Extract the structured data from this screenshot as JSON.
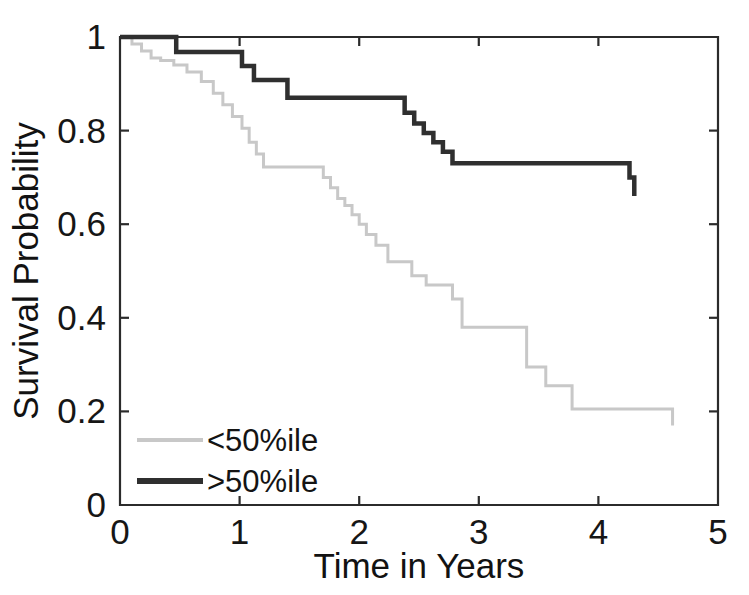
{
  "figure": {
    "background_color": "#ffffff",
    "plot_area": {
      "left": 120,
      "top": 37,
      "right": 718,
      "bottom": 505
    }
  },
  "chart_data": {
    "type": "line",
    "subtype": "kaplan-meier-step",
    "title": "",
    "xlabel": "Time in Years",
    "ylabel": "Survival Probability",
    "xlim": [
      0,
      5
    ],
    "ylim": [
      0,
      1
    ],
    "xticks": [
      0,
      1,
      2,
      3,
      4,
      5
    ],
    "xticklabels": [
      "0",
      "1",
      "2",
      "3",
      "4",
      "5"
    ],
    "yticks": [
      0,
      0.2,
      0.4,
      0.6,
      0.8,
      1
    ],
    "yticklabels": [
      "0",
      "0.2",
      "0.4",
      "0.6",
      "0.8",
      "1"
    ],
    "grid": false,
    "legend_position": "lower left",
    "series": [
      {
        "name": "<50%ile",
        "color": "#c8c8c8",
        "line_width": 3.0,
        "x": [
          0.0,
          0.1,
          0.18,
          0.26,
          0.34,
          0.45,
          0.56,
          0.68,
          0.78,
          0.86,
          0.94,
          1.02,
          1.08,
          1.14,
          1.2,
          1.62,
          1.7,
          1.76,
          1.82,
          1.88,
          1.94,
          2.0,
          2.06,
          2.14,
          2.24,
          2.34,
          2.44,
          2.56,
          2.78,
          2.86,
          3.3,
          3.4,
          3.56,
          3.78,
          4.62
        ],
        "y": [
          1.0,
          0.985,
          0.97,
          0.955,
          0.95,
          0.94,
          0.925,
          0.905,
          0.88,
          0.855,
          0.83,
          0.805,
          0.775,
          0.75,
          0.722,
          0.722,
          0.7,
          0.678,
          0.655,
          0.64,
          0.62,
          0.6,
          0.578,
          0.555,
          0.52,
          0.52,
          0.49,
          0.47,
          0.44,
          0.38,
          0.38,
          0.295,
          0.255,
          0.205,
          0.205
        ],
        "final_drop_to": 0.17,
        "end_x": 4.62
      },
      {
        "name": ">50%ile",
        "color": "#2f2f2f",
        "line_width": 4.5,
        "x": [
          0.0,
          0.47,
          0.92,
          1.02,
          1.12,
          1.4,
          2.3,
          2.38,
          2.46,
          2.54,
          2.62,
          2.7,
          2.78,
          4.1,
          4.26
        ],
        "y": [
          1.0,
          0.968,
          0.968,
          0.938,
          0.908,
          0.87,
          0.87,
          0.838,
          0.815,
          0.795,
          0.775,
          0.755,
          0.73,
          0.73,
          0.7
        ],
        "final_drop_to": 0.66,
        "end_x": 4.3
      }
    ]
  },
  "legend": {
    "entries": [
      {
        "label": "<50%ile",
        "color": "#c8c8c8",
        "line_width": 4
      },
      {
        "label": ">50%ile",
        "color": "#2f2f2f",
        "line_width": 6
      }
    ]
  }
}
